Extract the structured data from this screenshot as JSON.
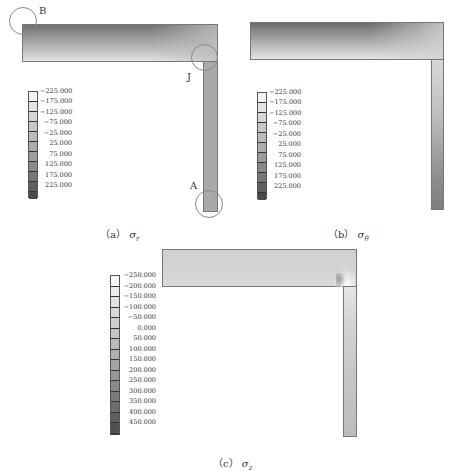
{
  "figure": {
    "panels": [
      {
        "id": "a",
        "caption_prefix": "（a）",
        "caption_symbol": "σ",
        "caption_sub": "r",
        "points": {
          "B": "B",
          "J": "J",
          "A": "A"
        },
        "legend": [
          "−225.000",
          "−175.000",
          "−125.000",
          "−75.000",
          "−25.000",
          "25.000",
          "75.000",
          "125.000",
          "175.000",
          "225.000"
        ],
        "legend_colors": [
          "#f4f4f4",
          "#e4e4e4",
          "#d6d6d6",
          "#c8c8c8",
          "#bababa",
          "#acacac",
          "#9c9c9c",
          "#8a8a8a",
          "#777777",
          "#5f5f5f",
          "#4a4a4a"
        ]
      },
      {
        "id": "b",
        "caption_prefix": "（b）",
        "caption_symbol": "σ",
        "caption_sub": "θ",
        "legend": [
          "−225.000",
          "−175.000",
          "−125.000",
          "−75.000",
          "−25.000",
          "25.000",
          "75.000",
          "125.000",
          "175.000",
          "225.000"
        ],
        "legend_colors": [
          "#f4f4f4",
          "#e4e4e4",
          "#d6d6d6",
          "#c8c8c8",
          "#bababa",
          "#acacac",
          "#9c9c9c",
          "#8a8a8a",
          "#777777",
          "#5f5f5f",
          "#4a4a4a"
        ]
      },
      {
        "id": "c",
        "caption_prefix": "（c）",
        "caption_symbol": "σ",
        "caption_sub": "z",
        "legend": [
          "−250.000",
          "−200.000",
          "−150.000",
          "−100.000",
          "−50.000",
          "0.000",
          "50.000",
          "100.000",
          "150.000",
          "200.000",
          "250.000",
          "300.000",
          "350.000",
          "400.000",
          "450.000"
        ],
        "legend_colors": [
          "#f6f6f6",
          "#ececec",
          "#e2e2e2",
          "#d8d8d8",
          "#cecece",
          "#c4c4c4",
          "#bababa",
          "#b0b0b0",
          "#a4a4a4",
          "#989898",
          "#8a8a8a",
          "#7c7c7c",
          "#6e6e6e",
          "#606060",
          "#525252",
          "#444444"
        ]
      }
    ]
  }
}
